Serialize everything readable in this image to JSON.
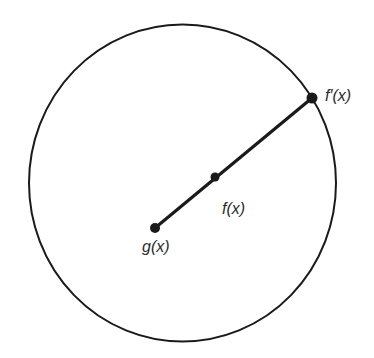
{
  "diagram": {
    "circle": {
      "cx": 182.5,
      "cy": 183,
      "rx": 153.5,
      "ry": 158.5,
      "stroke": "#1a1a1a"
    },
    "segment": {
      "from": "g",
      "to": "fprime",
      "stroke": "#1a1a1a"
    },
    "points": {
      "g": {
        "x": 155,
        "y": 228,
        "label": "g(x)",
        "label_x": 142,
        "label_y": 252
      },
      "f": {
        "x": 215,
        "y": 177,
        "label": "f(x)",
        "label_x": 222,
        "label_y": 214
      },
      "fprime": {
        "x": 312,
        "y": 98,
        "label": "f′(x)",
        "label_x": 325,
        "label_y": 101
      }
    }
  }
}
